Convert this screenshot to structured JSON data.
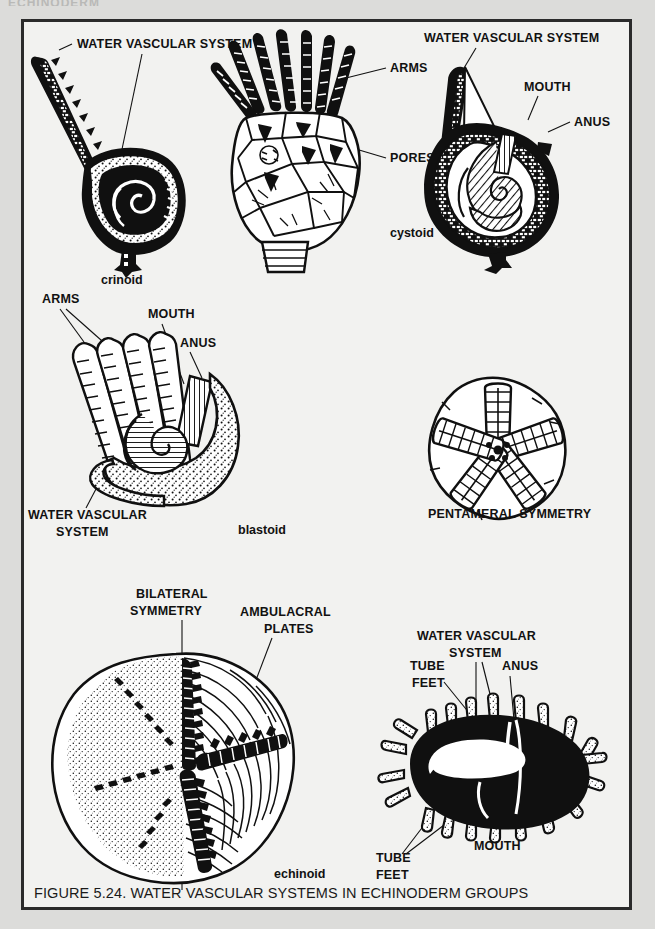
{
  "page": {
    "background_color": "#dcdcda",
    "frame_background": "#f2f2f0",
    "frame_border_color": "#2b2b2b",
    "ink_color": "#101010",
    "cut_off_top_text": "ECHINODERM"
  },
  "caption": {
    "text": "FIGURE 5.24. WATER VASCULAR SYSTEMS IN ECHINODERM GROUPS",
    "figure_number": "FIGURE 5.24.",
    "title": "WATER VASCULAR SYSTEMS IN ECHINODERM GROUPS"
  },
  "panels": [
    {
      "id": "crinoid",
      "name": "crinoid",
      "caption": "crinoid",
      "labels": [
        {
          "id": "crinoid-wvs",
          "text": "WATER VASCULAR SYSTEM"
        }
      ]
    },
    {
      "id": "cystoid",
      "name": "cystoid",
      "caption": "cystoid",
      "labels": [
        {
          "id": "cystoid-arms",
          "text": "ARMS"
        },
        {
          "id": "cystoid-pores",
          "text": "PORES"
        }
      ]
    },
    {
      "id": "crinoid-section",
      "name": "crinoid cross section",
      "caption": "",
      "labels": [
        {
          "id": "section-wvs",
          "text": "WATER VASCULAR SYSTEM"
        },
        {
          "id": "section-mouth",
          "text": "MOUTH"
        },
        {
          "id": "section-anus",
          "text": "ANUS"
        }
      ]
    },
    {
      "id": "blastoid",
      "name": "blastoid",
      "caption": "blastoid",
      "labels": [
        {
          "id": "blastoid-arms",
          "text": "ARMS"
        },
        {
          "id": "blastoid-mouth",
          "text": "MOUTH"
        },
        {
          "id": "blastoid-anus",
          "text": "ANUS"
        },
        {
          "id": "blastoid-wvs-line1",
          "text": "WATER VASCULAR"
        },
        {
          "id": "blastoid-wvs-line2",
          "text": "SYSTEM"
        }
      ]
    },
    {
      "id": "pentameral",
      "name": "pentameral symmetry",
      "caption": "PENTAMERAL SYMMETRY",
      "labels": []
    },
    {
      "id": "echinoid",
      "name": "echinoid",
      "caption": "echinoid",
      "labels": [
        {
          "id": "echinoid-bilateral-line1",
          "text": "BILATERAL"
        },
        {
          "id": "echinoid-bilateral-line2",
          "text": "SYMMETRY"
        },
        {
          "id": "echinoid-ambulacral-line1",
          "text": "AMBULACRAL"
        },
        {
          "id": "echinoid-ambulacral-line2",
          "text": "PLATES"
        }
      ]
    },
    {
      "id": "echinoid-section",
      "name": "echinoid cross section",
      "caption": "",
      "labels": [
        {
          "id": "urchin-wvs-line1",
          "text": "WATER VASCULAR"
        },
        {
          "id": "urchin-wvs-line2",
          "text": "SYSTEM"
        },
        {
          "id": "urchin-tubefeet-top-line1",
          "text": "TUBE"
        },
        {
          "id": "urchin-tubefeet-top-line2",
          "text": "FEET"
        },
        {
          "id": "urchin-anus",
          "text": "ANUS"
        },
        {
          "id": "urchin-mouth",
          "text": "MOUTH"
        },
        {
          "id": "urchin-tubefeet-bot-line1",
          "text": "TUBE"
        },
        {
          "id": "urchin-tubefeet-bot-line2",
          "text": "FEET"
        }
      ]
    }
  ]
}
